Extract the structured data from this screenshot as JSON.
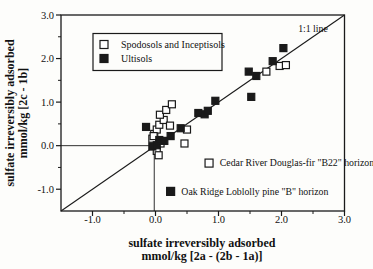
{
  "figure": {
    "background": "#fdfdfb",
    "ink": "#1a1a1a"
  },
  "chart_data": {
    "type": "scatter",
    "title": "",
    "xlabel": [
      "sulfate irreversibly adsorbed",
      "mmol/kg [2a - (2b - 1a)]"
    ],
    "ylabel": [
      "sulfate irreversibly adsorbed",
      "mmol/kg [2c - 1b]"
    ],
    "xlim": [
      -1.5,
      3.0
    ],
    "ylim": [
      -1.5,
      3.0
    ],
    "xticks": {
      "values": [
        -1,
        0,
        1,
        2,
        3
      ],
      "labels": [
        "-1.0",
        "0.0",
        "1.0",
        "2.0",
        "3.0"
      ]
    },
    "yticks": {
      "values": [
        -1,
        0,
        1,
        2,
        3
      ],
      "labels": [
        "-1.0",
        "0.0",
        "1.0",
        "2.0",
        "3.0"
      ]
    },
    "minor_ticks": [
      -0.5,
      0.5,
      1.5,
      2.5
    ],
    "grid": false,
    "legend": {
      "position": "upper-left-inside"
    },
    "series": [
      {
        "name": "Spodosols and Inceptisols",
        "marker": "open-square",
        "points": [
          [
            -0.05,
            0.16
          ],
          [
            -0.02,
            0.27
          ],
          [
            0.02,
            0.37
          ],
          [
            0.06,
            0.48
          ],
          [
            0.13,
            0.59
          ],
          [
            0.07,
            0.71
          ],
          [
            0.17,
            0.82
          ],
          [
            0.26,
            0.95
          ],
          [
            -0.03,
            0.22
          ],
          [
            0.08,
            0.05
          ],
          [
            0.02,
            -0.12
          ],
          [
            0.05,
            -0.22
          ],
          [
            0.23,
            0.46
          ],
          [
            0.5,
            0.37
          ],
          [
            0.46,
            0.05
          ],
          [
            1.76,
            1.7
          ],
          [
            1.97,
            1.83
          ],
          [
            2.07,
            1.85
          ]
        ]
      },
      {
        "name": "Ultisols",
        "marker": "filled-square",
        "points": [
          [
            -0.05,
            -0.02
          ],
          [
            0.02,
            0.01
          ],
          [
            0.06,
            0.13
          ],
          [
            0.14,
            0.11
          ],
          [
            -0.15,
            0.43
          ],
          [
            0.24,
            0.22
          ],
          [
            0.4,
            0.4
          ],
          [
            0.68,
            0.75
          ],
          [
            0.78,
            0.72
          ],
          [
            0.83,
            0.8
          ],
          [
            0.95,
            1.03
          ],
          [
            1.52,
            1.12
          ],
          [
            1.48,
            1.7
          ],
          [
            1.6,
            1.6
          ],
          [
            1.86,
            1.94
          ],
          [
            2.03,
            2.24
          ]
        ]
      }
    ],
    "one_to_one_line": {
      "from": [
        -1.5,
        -1.5
      ],
      "to": [
        3.0,
        3.0
      ],
      "label": "1:1 line",
      "label_xy": [
        2.5,
        2.62
      ]
    },
    "reference_lines": {
      "horizontal": {
        "y": 0.0,
        "x_from": -1.5,
        "x_to": -0.05
      },
      "vertical": {
        "x": -0.02,
        "y_from": -1.5,
        "y_to": 0.0
      }
    },
    "annotations": [
      {
        "marker": "open-square",
        "marker_xy": [
          0.85,
          -0.4
        ],
        "text_xy": [
          1.02,
          -0.4
        ],
        "text": "Cedar River Douglas-fir \"B22\" horizon"
      },
      {
        "marker": "filled-square",
        "marker_xy": [
          0.24,
          -1.05
        ],
        "text_xy": [
          0.41,
          -1.05
        ],
        "text": "Oak Ridge Loblolly pine \"B\" horizon"
      }
    ]
  }
}
